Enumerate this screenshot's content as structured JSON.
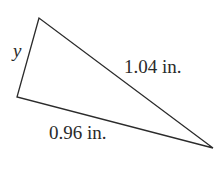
{
  "figure": {
    "type": "triangle",
    "stroke_color": "#2b2b2b",
    "fill_color": "#ffffff",
    "vertices": {
      "top": [
        39,
        18
      ],
      "left": [
        17,
        97
      ],
      "right": [
        213,
        148
      ]
    },
    "labels": {
      "side_top_left": "y",
      "side_top_right": "1.04 in.",
      "side_bottom": "0.96 in."
    }
  }
}
